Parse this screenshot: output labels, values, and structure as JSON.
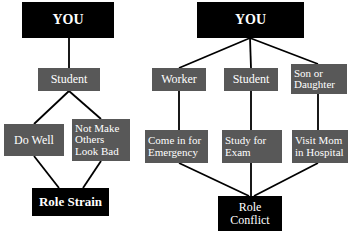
{
  "diagram": {
    "background_color": "#ffffff",
    "node_dark_color": "#000000",
    "node_gray_color": "#585858",
    "edge_color": "#000000",
    "text_color": "#ffffff",
    "left_tree": {
      "name": "role-strain-tree",
      "nodes": [
        {
          "id": "you-left",
          "label": "YOU",
          "style": "dark",
          "align": "center",
          "x": 22,
          "y": 2,
          "w": 92,
          "h": 36,
          "font_size": 14
        },
        {
          "id": "student-left",
          "label": "Student",
          "style": "gray",
          "align": "center",
          "x": 38,
          "y": 68,
          "w": 62,
          "h": 23,
          "font_size": 12
        },
        {
          "id": "do-well",
          "label": "Do Well",
          "style": "gray",
          "align": "center",
          "x": 4,
          "y": 124,
          "w": 60,
          "h": 32,
          "font_size": 12
        },
        {
          "id": "not-make-others-look-bad",
          "label": "Not Make\nOthers\nLook Bad",
          "style": "gray",
          "align": "left",
          "x": 72,
          "y": 119,
          "w": 58,
          "h": 42,
          "font_size": 11
        },
        {
          "id": "role-strain",
          "label": "Role Strain",
          "style": "dark",
          "align": "center",
          "x": 32,
          "y": 188,
          "w": 77,
          "h": 28,
          "font_size": 13
        }
      ],
      "edges": [
        {
          "id": "you-to-student",
          "x1": 69,
          "y1": 38,
          "x2": 69,
          "y2": 68
        },
        {
          "id": "student-to-do-well",
          "x1": 69,
          "y1": 91,
          "x2": 34,
          "y2": 124
        },
        {
          "id": "student-to-not-make-others",
          "x1": 69,
          "y1": 91,
          "x2": 101,
          "y2": 119
        },
        {
          "id": "do-well-to-role-strain",
          "x1": 34,
          "y1": 156,
          "x2": 59,
          "y2": 188
        },
        {
          "id": "not-make-others-to-role-strain",
          "x1": 101,
          "y1": 161,
          "x2": 83,
          "y2": 188
        }
      ]
    },
    "right_tree": {
      "name": "role-conflict-tree",
      "nodes": [
        {
          "id": "you-right",
          "label": "YOU",
          "style": "dark",
          "align": "center",
          "x": 197,
          "y": 2,
          "w": 107,
          "h": 36,
          "font_size": 14
        },
        {
          "id": "worker",
          "label": "Worker",
          "style": "gray",
          "align": "center",
          "x": 152,
          "y": 68,
          "w": 54,
          "h": 23,
          "font_size": 12
        },
        {
          "id": "student-right",
          "label": "Student",
          "style": "gray",
          "align": "center",
          "x": 224,
          "y": 68,
          "w": 54,
          "h": 23,
          "font_size": 12
        },
        {
          "id": "son-or-daughter",
          "label": "Son or\nDaughter",
          "style": "gray",
          "align": "left",
          "x": 291,
          "y": 64,
          "w": 56,
          "h": 30,
          "font_size": 11
        },
        {
          "id": "come-in-for-emergency",
          "label": "Come in for\nEmergency",
          "style": "gray",
          "align": "left",
          "x": 145,
          "y": 130,
          "w": 63,
          "h": 33,
          "font_size": 11
        },
        {
          "id": "study-for-exam",
          "label": "Study for\nExam",
          "style": "gray",
          "align": "left",
          "x": 222,
          "y": 130,
          "w": 60,
          "h": 33,
          "font_size": 11
        },
        {
          "id": "visit-mom-in-hospital",
          "label": "Visit Mom\nin Hospital",
          "style": "gray",
          "align": "left",
          "x": 292,
          "y": 130,
          "w": 56,
          "h": 33,
          "font_size": 11
        },
        {
          "id": "role-conflict",
          "label": "Role\nConflict",
          "style": "dark",
          "align": "center",
          "x": 218,
          "y": 196,
          "w": 64,
          "h": 35,
          "font_size": 12
        }
      ],
      "edges": [
        {
          "id": "you-to-worker",
          "x1": 250,
          "y1": 38,
          "x2": 179,
          "y2": 68
        },
        {
          "id": "you-to-student",
          "x1": 250,
          "y1": 38,
          "x2": 251,
          "y2": 68
        },
        {
          "id": "you-to-son-or-daughter",
          "x1": 250,
          "y1": 38,
          "x2": 318,
          "y2": 64
        },
        {
          "id": "worker-to-emergency",
          "x1": 179,
          "y1": 91,
          "x2": 179,
          "y2": 130
        },
        {
          "id": "student-to-exam",
          "x1": 251,
          "y1": 91,
          "x2": 251,
          "y2": 130
        },
        {
          "id": "son-to-visit-mom",
          "x1": 318,
          "y1": 94,
          "x2": 318,
          "y2": 130
        },
        {
          "id": "emergency-to-role-conflict",
          "x1": 179,
          "y1": 163,
          "x2": 249,
          "y2": 196
        },
        {
          "id": "exam-to-role-conflict",
          "x1": 251,
          "y1": 163,
          "x2": 251,
          "y2": 196
        },
        {
          "id": "visit-mom-to-role-conflict",
          "x1": 318,
          "y1": 163,
          "x2": 254,
          "y2": 196
        }
      ]
    }
  }
}
